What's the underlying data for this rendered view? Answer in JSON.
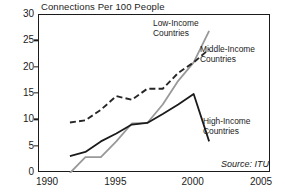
{
  "chart_data": {
    "type": "line",
    "title": "Connections Per 100 People",
    "xlabel": "",
    "ylabel": "",
    "xlim": [
      1990,
      2005
    ],
    "ylim": [
      0,
      30
    ],
    "xticks": [
      1990,
      1995,
      2000,
      2005
    ],
    "yticks": [
      0,
      5,
      10,
      15,
      20,
      25,
      30
    ],
    "grid": false,
    "legend_position": "inline-annotations",
    "source": "Source: ITU",
    "series": [
      {
        "name": "Low-Income Countries",
        "style": "solid",
        "color": "#999999",
        "x": [
          1992,
          1993,
          1994,
          1995,
          1996,
          1997,
          1998,
          1999,
          2000,
          2001
        ],
        "values": [
          0,
          3,
          3,
          6,
          9.4,
          9.5,
          13,
          17.5,
          21,
          27
        ]
      },
      {
        "name": "Middle-Income Countries",
        "style": "dashed",
        "color": "#262626",
        "x": [
          1992,
          1993,
          1994,
          1995,
          1996,
          1997,
          1998,
          1999,
          2000,
          2001
        ],
        "values": [
          9.6,
          10,
          12,
          14.6,
          13.9,
          16,
          16,
          19,
          21,
          23.5
        ]
      },
      {
        "name": "High-Income Countries",
        "style": "solid",
        "color": "#1b1b1b",
        "x": [
          1992,
          1993,
          1994,
          1995,
          1996,
          1997,
          1998,
          1999,
          2000,
          2001
        ],
        "values": [
          3.2,
          4,
          6,
          7.5,
          9.2,
          9.5,
          11.2,
          13,
          15,
          6
        ]
      }
    ]
  },
  "title": {
    "text": "Connections Per 100 People"
  },
  "axes": {
    "y": {
      "ticks": [
        {
          "label": "30",
          "value": 30
        },
        {
          "label": "25",
          "value": 25
        },
        {
          "label": "20",
          "value": 20
        },
        {
          "label": "15",
          "value": 15
        },
        {
          "label": "10",
          "value": 10
        },
        {
          "label": "5",
          "value": 5
        },
        {
          "label": "0",
          "value": 0
        }
      ]
    },
    "x": {
      "ticks": [
        {
          "label": "1990",
          "value": 1990
        },
        {
          "label": "1995",
          "value": 1995
        },
        {
          "label": "2000",
          "value": 2000
        },
        {
          "label": "2005",
          "value": 2005
        }
      ]
    }
  },
  "annotations": {
    "low_income": "Low-Income\nCountries",
    "low_income_line1": "Low-Income",
    "low_income_line2": "Countries",
    "middle_income_line1": "Middle-Income",
    "middle_income_line2": "Countries",
    "high_income_line1": "High-Income",
    "high_income_line2": "Countries",
    "source": "Source: ITU"
  }
}
